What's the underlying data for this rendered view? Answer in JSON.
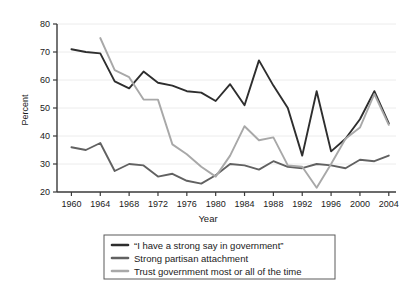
{
  "chart_data": {
    "type": "line",
    "title": "",
    "xlabel": "Year",
    "ylabel": "Percent",
    "xlim": [
      1958,
      2005
    ],
    "ylim": [
      20,
      80
    ],
    "grid": true,
    "legend_position": "bottom",
    "xticks": [
      1960,
      1964,
      1968,
      1972,
      1976,
      1980,
      1984,
      1988,
      1992,
      1996,
      2000,
      2004
    ],
    "yticks": [
      20,
      30,
      40,
      50,
      60,
      70,
      80
    ],
    "series": [
      {
        "name": "“I have a strong say in government”",
        "color": "#2e2e2e",
        "x": [
          1960,
          1962,
          1964,
          1966,
          1968,
          1970,
          1972,
          1974,
          1976,
          1978,
          1980,
          1982,
          1984,
          1986,
          1988,
          1990,
          1992,
          1994,
          1996,
          1998,
          2000,
          2002,
          2004
        ],
        "values": [
          71,
          70,
          69.5,
          59.5,
          57,
          63,
          59,
          58,
          56,
          55.5,
          52.5,
          58.5,
          51,
          67,
          58,
          50,
          33,
          56,
          34.5,
          39,
          46,
          56,
          44.5
        ]
      },
      {
        "name": "Strong partisan attachment",
        "color": "#616161",
        "x": [
          1960,
          1962,
          1964,
          1966,
          1968,
          1970,
          1972,
          1974,
          1976,
          1978,
          1980,
          1982,
          1984,
          1986,
          1988,
          1990,
          1992,
          1994,
          1996,
          1998,
          2000,
          2002,
          2004
        ],
        "values": [
          36,
          35,
          37.5,
          27.5,
          30,
          29.5,
          25.5,
          26.5,
          24,
          23,
          26,
          30,
          29.5,
          28,
          31,
          29,
          28.5,
          30,
          29.5,
          28.5,
          31.5,
          31,
          33
        ]
      },
      {
        "name": "Trust government most or all of the time",
        "color": "#a8a8a8",
        "x": [
          1964,
          1966,
          1968,
          1970,
          1972,
          1974,
          1976,
          1978,
          1980,
          1982,
          1984,
          1986,
          1988,
          1990,
          1992,
          1994,
          1996,
          1998,
          2000,
          2002,
          2004
        ],
        "values": [
          75,
          63.5,
          61,
          53,
          53,
          37,
          33.5,
          29,
          25.5,
          33,
          43.5,
          38.5,
          39.5,
          29.5,
          29,
          21.5,
          30,
          39,
          43,
          55,
          44
        ]
      }
    ]
  },
  "legend": {
    "items": [
      {
        "label": "“I have a strong say in government”"
      },
      {
        "label": "Strong partisan attachment"
      },
      {
        "label": "Trust government most or all of the time"
      }
    ]
  }
}
